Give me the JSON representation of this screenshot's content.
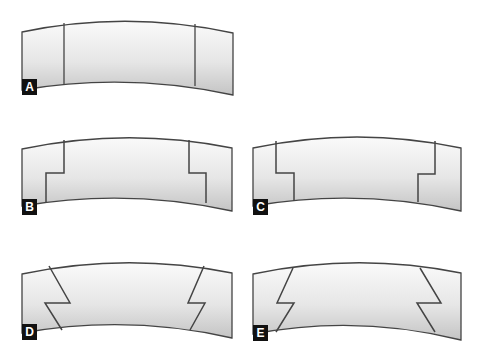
{
  "colors": {
    "stroke": "#444444",
    "fill_top": "#fafafa",
    "fill_bottom": "#c4c4c4",
    "label_bg": "#111111",
    "label_text": "#ffffff"
  },
  "panels": [
    {
      "id": "A",
      "label": "A",
      "joint": "straight vertical cuts"
    },
    {
      "id": "B",
      "label": "B",
      "joint": "stepped cuts, step outward at bottom"
    },
    {
      "id": "C",
      "label": "C",
      "joint": "stepped cuts, step inward at bottom"
    },
    {
      "id": "D",
      "label": "D",
      "joint": "angled notched cuts, converging toward bottom"
    },
    {
      "id": "E",
      "label": "E",
      "joint": "angled notched cuts, diverging toward bottom"
    }
  ]
}
